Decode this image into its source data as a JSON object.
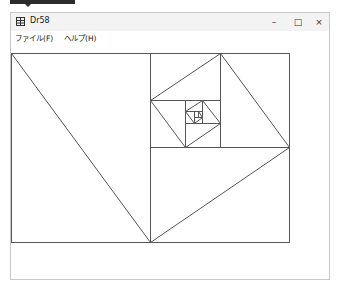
{
  "window": {
    "title": "Dr58",
    "icon": "app-grid-icon",
    "controls": {
      "minimize": "–",
      "maximize": "□",
      "close": "×"
    }
  },
  "menu": {
    "items": [
      {
        "label": "ファイル(F)"
      },
      {
        "label": "ヘルプ(H)"
      }
    ]
  },
  "drawing": {
    "stroke": "#555555",
    "outer_rect": [
      11,
      53,
      289,
      242
    ],
    "rects": [
      [
        11,
        53,
        150,
        242
      ],
      [
        150,
        147,
        289,
        242
      ],
      [
        150,
        53,
        289,
        147
      ],
      [
        220,
        53,
        289,
        147
      ],
      [
        150,
        53,
        220,
        100
      ],
      [
        150,
        100,
        185,
        147
      ],
      [
        185,
        100,
        220,
        147
      ],
      [
        185,
        123,
        220,
        147
      ],
      [
        202,
        100,
        220,
        123
      ],
      [
        185,
        100,
        202,
        111
      ],
      [
        185,
        111,
        194,
        123
      ],
      [
        194,
        117,
        202,
        123
      ],
      [
        198,
        111,
        202,
        117
      ]
    ],
    "diagonals": [
      [
        11,
        53,
        150,
        242
      ],
      [
        150,
        242,
        289,
        147
      ],
      [
        289,
        147,
        220,
        53
      ],
      [
        220,
        53,
        150,
        100
      ],
      [
        150,
        100,
        185,
        147
      ],
      [
        185,
        147,
        220,
        123
      ],
      [
        220,
        123,
        202,
        100
      ],
      [
        202,
        100,
        185,
        111
      ],
      [
        185,
        111,
        194,
        123
      ],
      [
        194,
        123,
        202,
        117
      ],
      [
        202,
        117,
        198,
        111
      ]
    ]
  }
}
